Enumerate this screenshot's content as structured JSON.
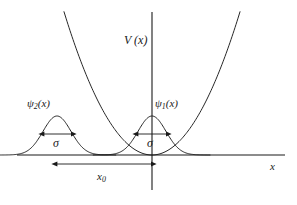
{
  "figure": {
    "background_color": "#ffffff",
    "stroke_color": "#1a1a1a",
    "text_color": "#1a1a1a"
  },
  "labels": {
    "potential": "V (x)",
    "wavefunction_left": "ψ",
    "wavefunction_left_sub": "2",
    "wavefunction_left_arg": "(x)",
    "wavefunction_right": "ψ",
    "wavefunction_right_sub": "1",
    "wavefunction_right_arg": "(x)",
    "sigma_left": "σ",
    "sigma_right": "σ",
    "separation": "x",
    "separation_sub": "0",
    "axis_x": "x"
  },
  "chart_data": {
    "type": "line",
    "title": "V (x)",
    "xlabel": "x",
    "ylabel": "V (x)",
    "grid": false,
    "legend": false,
    "origin_px": {
      "x": 152,
      "y": 155
    },
    "axes": {
      "x_axis": {
        "x_start_px": 17,
        "x_end_px": 285,
        "y_px": 155
      },
      "v_axis": {
        "x_px": 152,
        "y_top_px": 12,
        "y_bottom_px": 190
      }
    },
    "series": [
      {
        "name": "V (x)",
        "kind": "parabola",
        "description": "Harmonic potential, vertex at origin, opens upward",
        "vertex_px": {
          "x": 152,
          "y": 155
        },
        "curvature_k": 0.0185,
        "x_range_px": [
          62,
          242
        ],
        "y_top_px": 10
      },
      {
        "name": "ψ₂(x)",
        "kind": "gaussian",
        "description": "Left displaced Gaussian wavepacket",
        "center_px": 57,
        "peak_y_px": 116,
        "baseline_y_px": 155,
        "amplitude_px": 39,
        "sigma_px": 14
      },
      {
        "name": "ψ₁(x)",
        "kind": "gaussian",
        "description": "Right Gaussian wavepacket centred at the origin",
        "center_px": 152,
        "peak_y_px": 116,
        "baseline_y_px": 155,
        "amplitude_px": 39,
        "sigma_px": 14
      }
    ],
    "annotations": [
      {
        "name": "sigma-left",
        "label": "σ",
        "kind": "double-arrow",
        "y_px": 134,
        "x_from_px": 44,
        "x_to_px": 72
      },
      {
        "name": "sigma-right",
        "label": "σ",
        "kind": "double-arrow",
        "y_px": 134,
        "x_from_px": 138,
        "x_to_px": 167
      },
      {
        "name": "x0-separation",
        "label": "x₀",
        "kind": "double-arrow",
        "y_px": 164,
        "x_from_px": 57,
        "x_to_px": 152
      }
    ]
  }
}
